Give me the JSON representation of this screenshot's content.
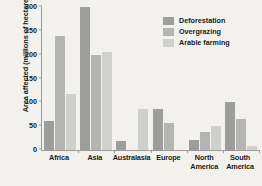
{
  "chart_data": {
    "type": "bar",
    "title": "",
    "xlabel": "",
    "ylabel": "Area affected (millions of hectares)",
    "ylim": [
      0,
      300
    ],
    "yticks": [
      0,
      50,
      100,
      150,
      200,
      250,
      300
    ],
    "grid": false,
    "legend_position": "top-right",
    "categories": [
      "Africa",
      "Asia",
      "Australasia",
      "Europe",
      "North America",
      "South America"
    ],
    "series": [
      {
        "name": "Deforestation",
        "color": "#9d9d9b",
        "values": [
          60,
          300,
          18,
          85,
          20,
          100
        ]
      },
      {
        "name": "Overgrazing",
        "color": "#b4b4b2",
        "values": [
          240,
          200,
          0,
          57,
          38,
          65
        ]
      },
      {
        "name": "Arable farming",
        "color": "#cfcfcc",
        "values": [
          117,
          205,
          85,
          0,
          50,
          8
        ]
      }
    ]
  },
  "axes": {
    "y_title": "Area affected (millions of hectares)",
    "y_tick_labels": [
      "300",
      "250",
      "200",
      "150",
      "100",
      "50",
      "0"
    ]
  },
  "legend": {
    "items": [
      {
        "label": "Deforestation"
      },
      {
        "label": "Overgrazing"
      },
      {
        "label": "Arable farming"
      }
    ]
  }
}
